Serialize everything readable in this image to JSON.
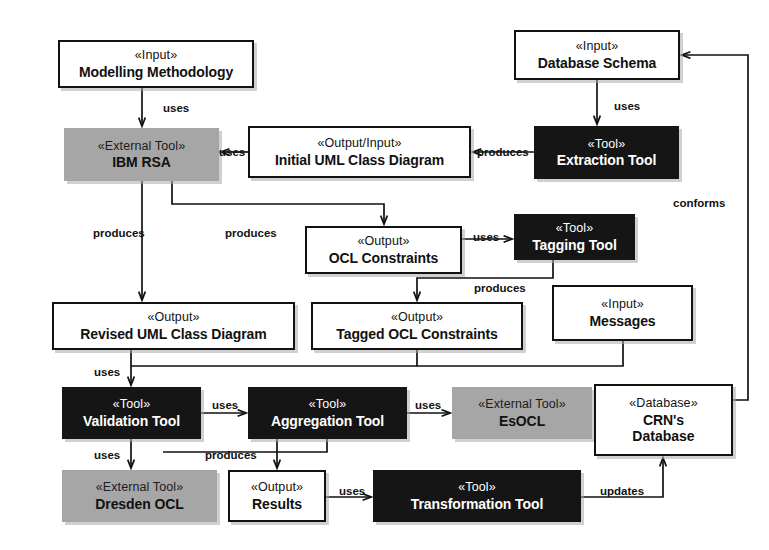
{
  "diagram": {
    "nodes": [
      {
        "id": "modelling_methodology",
        "stereotype": "«Input»",
        "name": "Modelling Methodology",
        "kind": "white",
        "x": 58,
        "y": 40,
        "w": 196,
        "h": 48
      },
      {
        "id": "database_schema",
        "stereotype": "«Input»",
        "name": "Database Schema",
        "kind": "white",
        "x": 514,
        "y": 30,
        "w": 166,
        "h": 50
      },
      {
        "id": "ibm_rsa",
        "stereotype": "«External Tool»",
        "name": "IBM RSA",
        "kind": "gray",
        "x": 64,
        "y": 128,
        "w": 155,
        "h": 53
      },
      {
        "id": "initial_uml",
        "stereotype": "«Output/Input»",
        "name": "Initial UML Class Diagram",
        "kind": "white",
        "x": 248,
        "y": 126,
        "w": 223,
        "h": 52
      },
      {
        "id": "extraction_tool",
        "stereotype": "«Tool»",
        "name": "Extraction Tool",
        "kind": "black",
        "x": 534,
        "y": 126,
        "w": 145,
        "h": 53
      },
      {
        "id": "ocl_constraints",
        "stereotype": "«Output»",
        "name": "OCL Constraints",
        "kind": "white",
        "x": 305,
        "y": 226,
        "w": 157,
        "h": 48
      },
      {
        "id": "tagging_tool",
        "stereotype": "«Tool»",
        "name": "Tagging Tool",
        "kind": "black",
        "x": 514,
        "y": 214,
        "w": 121,
        "h": 46
      },
      {
        "id": "revised_uml",
        "stereotype": "«Output»",
        "name": "Revised UML Class Diagram",
        "kind": "white",
        "x": 52,
        "y": 302,
        "w": 243,
        "h": 48
      },
      {
        "id": "tagged_ocl",
        "stereotype": "«Output»",
        "name": "Tagged OCL Constraints",
        "kind": "white",
        "x": 311,
        "y": 302,
        "w": 212,
        "h": 48
      },
      {
        "id": "messages",
        "stereotype": "«Input»",
        "name": "Messages",
        "kind": "white",
        "x": 552,
        "y": 285,
        "w": 141,
        "h": 56
      },
      {
        "id": "validation_tool",
        "stereotype": "«Tool»",
        "name": "Validation Tool",
        "kind": "black",
        "x": 62,
        "y": 387,
        "w": 139,
        "h": 52
      },
      {
        "id": "aggregation_tool",
        "stereotype": "«Tool»",
        "name": "Aggregation Tool",
        "kind": "black",
        "x": 248,
        "y": 387,
        "w": 159,
        "h": 52
      },
      {
        "id": "esocl",
        "stereotype": "«External Tool»",
        "name": "EsOCL",
        "kind": "gray",
        "x": 452,
        "y": 387,
        "w": 140,
        "h": 52
      },
      {
        "id": "crns_database",
        "stereotype": "«Database»",
        "name": "CRN's",
        "name2": "Database",
        "kind": "white",
        "x": 594,
        "y": 384,
        "w": 139,
        "h": 72
      },
      {
        "id": "dresden_ocl",
        "stereotype": "«External Tool»",
        "name": "Dresden OCL",
        "kind": "gray",
        "x": 62,
        "y": 470,
        "w": 155,
        "h": 52
      },
      {
        "id": "results",
        "stereotype": "«Output»",
        "name": "Results",
        "kind": "white",
        "x": 228,
        "y": 470,
        "w": 98,
        "h": 52
      },
      {
        "id": "transformation_tool",
        "stereotype": "«Tool»",
        "name": "Transformation Tool",
        "kind": "black",
        "x": 373,
        "y": 470,
        "w": 208,
        "h": 52
      }
    ],
    "edges": [
      {
        "id": "e-mm-rsa",
        "from": "modelling_methodology",
        "to": "ibm_rsa",
        "label": "uses",
        "label_x": 163,
        "label_y": 103
      },
      {
        "id": "e-iuml-rsa",
        "from": "initial_uml",
        "to": "ibm_rsa",
        "label": "uses",
        "label_x": 219,
        "label_y": 147
      },
      {
        "id": "e-ds-et",
        "from": "database_schema",
        "to": "extraction_tool",
        "label": "uses",
        "label_x": 614,
        "label_y": 101
      },
      {
        "id": "e-et-iuml",
        "from": "extraction_tool",
        "to": "initial_uml",
        "label": "produces",
        "label_x": 477,
        "label_y": 147
      },
      {
        "id": "e-rsa-ocl",
        "from": "ibm_rsa",
        "to": "ocl_constraints",
        "label": "produces",
        "label_x": 225,
        "label_y": 228
      },
      {
        "id": "e-rsa-revised",
        "from": "ibm_rsa",
        "to": "revised_uml",
        "label": "produces",
        "label_x": 93,
        "label_y": 228
      },
      {
        "id": "e-ocl-tag",
        "from": "ocl_constraints",
        "to": "tagging_tool",
        "label": "uses",
        "label_x": 473,
        "label_y": 232
      },
      {
        "id": "e-tag-tagged",
        "from": "tagging_tool",
        "to": "tagged_ocl",
        "label": "produces",
        "label_x": 474,
        "label_y": 283
      },
      {
        "id": "e-revised-val",
        "from": "revised_uml",
        "to": "validation_tool",
        "label": "uses",
        "label_x": 94,
        "label_y": 367
      },
      {
        "id": "e-tagged-val",
        "from": "tagged_ocl",
        "to": "validation_tool",
        "label": "",
        "label_x": 0,
        "label_y": 0
      },
      {
        "id": "e-msg-val",
        "from": "messages",
        "to": "validation_tool",
        "label": "",
        "label_x": 0,
        "label_y": 0
      },
      {
        "id": "e-val-agg",
        "from": "validation_tool",
        "to": "aggregation_tool",
        "label": "uses",
        "label_x": 212,
        "label_y": 400
      },
      {
        "id": "e-agg-esocl",
        "from": "aggregation_tool",
        "to": "esocl",
        "label": "uses",
        "label_x": 415,
        "label_y": 400
      },
      {
        "id": "e-val-dresden",
        "from": "validation_tool",
        "to": "dresden_ocl",
        "label": "uses",
        "label_x": 94,
        "label_y": 450
      },
      {
        "id": "e-agg-results",
        "from": "aggregation_tool",
        "to": "results",
        "label": "produces",
        "label_x": 205,
        "label_y": 450
      },
      {
        "id": "e-results-trans",
        "from": "results",
        "to": "transformation_tool",
        "label": "uses",
        "label_x": 339,
        "label_y": 486
      },
      {
        "id": "e-trans-crn",
        "from": "transformation_tool",
        "to": "crns_database",
        "label": "updates",
        "label_x": 600,
        "label_y": 486
      },
      {
        "id": "e-crn-ds",
        "from": "crns_database",
        "to": "database_schema",
        "label": "conforms",
        "label_x": 673,
        "label_y": 198
      }
    ]
  }
}
